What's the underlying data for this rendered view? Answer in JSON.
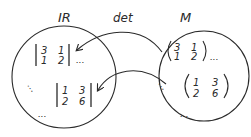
{
  "diagram": {
    "sets": [
      {
        "id": "reals",
        "label": "IR",
        "description": "set of real numbers (codomain)"
      },
      {
        "id": "matrices",
        "label": "M",
        "description": "set of 2x2 matrices (domain)"
      }
    ],
    "mapping_label": "det",
    "matrices": [
      {
        "id": "m1",
        "row1": [
          "3",
          "1"
        ],
        "row2": [
          "1",
          "2"
        ]
      },
      {
        "id": "m2",
        "row1": [
          "1",
          "3"
        ],
        "row2": [
          "2",
          "6"
        ]
      }
    ],
    "determinants": [
      {
        "id": "d1",
        "row1": [
          "3",
          "1"
        ],
        "row2": [
          "1",
          "2"
        ]
      },
      {
        "id": "d2",
        "row1": [
          "1",
          "3"
        ],
        "row2": [
          "2",
          "6"
        ]
      }
    ],
    "ellipsis": "...",
    "vertical_dots": "⋮",
    "arrows": [
      {
        "from": "m1",
        "to": "d1"
      },
      {
        "from": "m2",
        "to": "d2"
      }
    ],
    "colors": {
      "ink": "#2a2a2a",
      "background": "#ffffff"
    }
  }
}
